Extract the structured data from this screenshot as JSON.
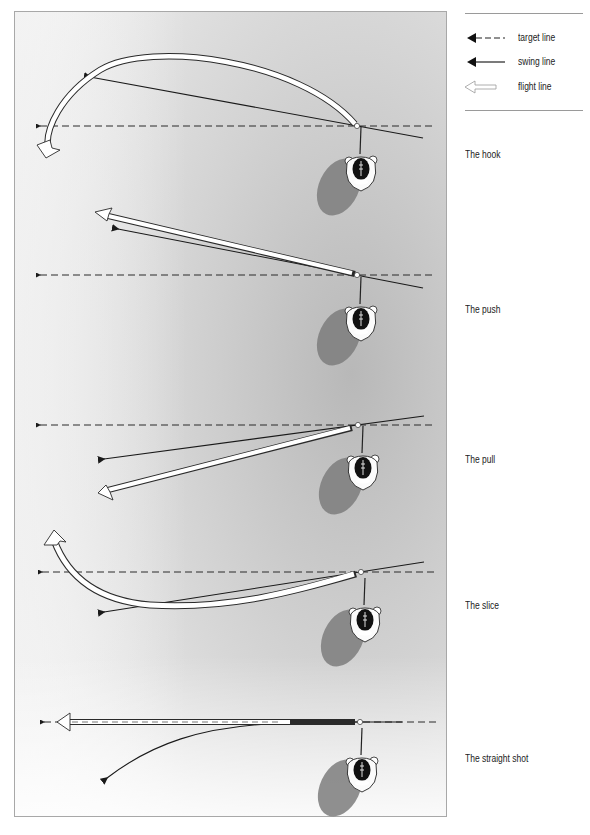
{
  "legend": {
    "items": [
      {
        "key": "target",
        "label": "target line",
        "icon": "dashed-arrow-icon"
      },
      {
        "key": "swing",
        "label": "swing line",
        "icon": "solid-arrow-icon"
      },
      {
        "key": "flight",
        "label": "flight line",
        "icon": "hollow-arrow-icon"
      }
    ]
  },
  "shots": [
    {
      "name": "hook",
      "label": "The hook"
    },
    {
      "name": "push",
      "label": "The push"
    },
    {
      "name": "pull",
      "label": "The pull"
    },
    {
      "name": "slice",
      "label": "The slice"
    },
    {
      "name": "straight",
      "label": "The straight shot"
    }
  ],
  "colors": {
    "line": "#1a1a1a",
    "background_dark": "#bdbdbd",
    "background_light": "#fafafa",
    "flight_fill": "#ffffff",
    "shadow": "#7a7a7a"
  }
}
